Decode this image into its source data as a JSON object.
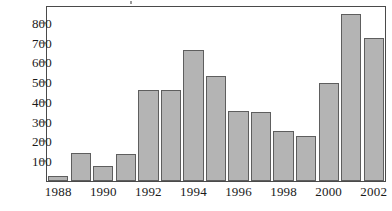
{
  "chart_data": {
    "type": "bar",
    "title": "",
    "subtitle": "",
    "xlabel": "",
    "ylabel": "",
    "categories": [
      "1988",
      "1989",
      "1990",
      "1991",
      "1992",
      "1993",
      "1994",
      "1995",
      "1996",
      "1997",
      "1998",
      "1999",
      "2000",
      "2001",
      "2002"
    ],
    "values": [
      25,
      140,
      78,
      135,
      462,
      458,
      665,
      533,
      355,
      350,
      253,
      228,
      495,
      845,
      722
    ],
    "x_tick_labels": [
      "1988",
      "1990",
      "1992",
      "1994",
      "1996",
      "1998",
      "2000",
      "2002"
    ],
    "x_tick_categories": [
      "1988",
      "1990",
      "1992",
      "1994",
      "1996",
      "1998",
      "2000",
      "2002"
    ],
    "y_tick_labels": [
      "800",
      "700",
      "600",
      "500",
      "400",
      "300",
      "200",
      "100"
    ],
    "y_ticks": [
      800,
      700,
      600,
      500,
      400,
      300,
      200,
      100
    ],
    "ylim": [
      0,
      880
    ],
    "grid": false,
    "legend": false,
    "legend_position": "none",
    "bar_color": "#b4b4b4",
    "bar_border_color": "#5e5e5e",
    "axis_color": "#4a4a4a",
    "text_color": "#1a1a1a",
    "background_color": "#ffffff"
  }
}
